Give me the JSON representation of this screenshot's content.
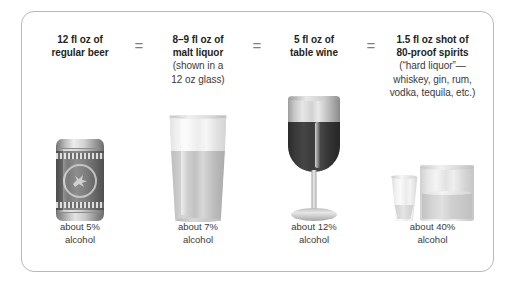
{
  "figure": {
    "equals_symbol": "=",
    "columns": [
      {
        "id": "regular-beer",
        "title_lines": [
          "12 fl oz of",
          "regular beer"
        ],
        "note_lines": [],
        "footer_lines": [
          "about 5%",
          "alcohol"
        ],
        "icon": "beer-can-icon"
      },
      {
        "id": "malt-liquor",
        "title_lines": [
          "8–9 fl oz of",
          "malt liquor"
        ],
        "note_lines": [
          "(shown in a",
          "12 oz glass)"
        ],
        "footer_lines": [
          "about 7%",
          "alcohol"
        ],
        "icon": "pint-glass-icon"
      },
      {
        "id": "table-wine",
        "title_lines": [
          "5 fl oz of",
          "table wine"
        ],
        "note_lines": [],
        "footer_lines": [
          "about 12%",
          "alcohol"
        ],
        "icon": "wine-glass-icon"
      },
      {
        "id": "spirits",
        "title_lines": [
          "1.5 fl oz shot of",
          "80-proof spirits"
        ],
        "note_lines": [
          "(“hard liquor”—",
          "whiskey, gin, rum,",
          "vodka, tequila, etc.)"
        ],
        "footer_lines": [
          "about 40%",
          "alcohol"
        ],
        "icon": "shot-glass-icon"
      }
    ],
    "colors": {
      "text": "#231f20",
      "secondary_text": "#3a3a3a",
      "equals": "#808080",
      "frame_border": "#b9b9b9",
      "background": "#ffffff"
    }
  }
}
